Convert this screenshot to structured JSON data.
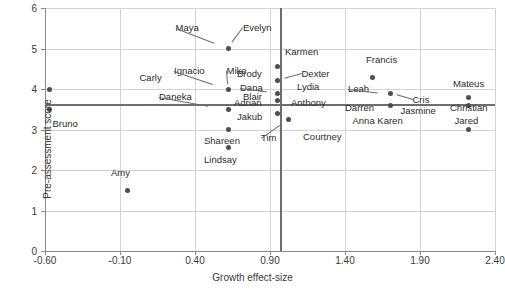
{
  "chart_data": {
    "type": "scatter",
    "title": "",
    "xlabel": "Growth effect-size",
    "ylabel": "Pre-assessment score",
    "xlim": [
      -0.6,
      2.4
    ],
    "ylim": [
      0,
      6
    ],
    "xticks": [
      "-0.60",
      "-0.10",
      "0.40",
      "0.90",
      "1.40",
      "1.90",
      "2.40"
    ],
    "xtick_values": [
      -0.6,
      -0.1,
      0.4,
      0.9,
      1.4,
      1.9,
      2.4
    ],
    "yticks": [
      "0",
      "1",
      "2",
      "3",
      "4",
      "5",
      "6"
    ],
    "ytick_values": [
      0,
      1,
      2,
      3,
      4,
      5,
      6
    ],
    "grid": true,
    "legend": "none",
    "reference_lines": [
      {
        "name": "mean-pre-assessment-line",
        "orientation": "horizontal",
        "value": 3.6
      },
      {
        "name": "mean-growth-line",
        "orientation": "vertical",
        "value": 0.97
      }
    ],
    "points": [
      {
        "label": "Carly",
        "x": -0.57,
        "y": 4.0,
        "lx": 0.03,
        "ly": 4.28,
        "anchor": "start",
        "leader": false
      },
      {
        "label": "Bruno",
        "x": -0.57,
        "y": 3.5,
        "lx": -0.55,
        "ly": 3.14,
        "anchor": "start",
        "leader": false
      },
      {
        "label": "Amy",
        "x": -0.05,
        "y": 1.5,
        "lx": -0.16,
        "ly": 1.92,
        "anchor": "start",
        "leader": false
      },
      {
        "label": "Evelyn",
        "x": 0.62,
        "y": 5.0,
        "lx": 0.72,
        "ly": 5.5,
        "anchor": "start",
        "leader": true
      },
      {
        "label": "Maya",
        "x": 0.62,
        "y": 5.0,
        "lx": 0.27,
        "ly": 5.5,
        "anchor": "start",
        "leader": true
      },
      {
        "label": "Mike",
        "x": 0.62,
        "y": 4.0,
        "lx": 0.61,
        "ly": 4.45,
        "anchor": "start",
        "leader": true
      },
      {
        "label": "Ignacio",
        "x": 0.62,
        "y": 4.0,
        "lx": 0.26,
        "ly": 4.45,
        "anchor": "start",
        "leader": true
      },
      {
        "label": "Blair",
        "x": 0.62,
        "y": 3.5,
        "lx": 0.72,
        "ly": 3.8,
        "anchor": "start",
        "leader": false
      },
      {
        "label": "Daneka",
        "x": 0.62,
        "y": 3.5,
        "lx": 0.16,
        "ly": 3.8,
        "anchor": "start",
        "leader": true
      },
      {
        "label": "Shareen",
        "x": 0.62,
        "y": 3.0,
        "lx": 0.46,
        "ly": 2.72,
        "anchor": "start",
        "leader": false
      },
      {
        "label": "Lindsay",
        "x": 0.62,
        "y": 2.55,
        "lx": 0.46,
        "ly": 2.25,
        "anchor": "start",
        "leader": false
      },
      {
        "label": "Karmen",
        "x": 0.95,
        "y": 4.55,
        "lx": 1.0,
        "ly": 4.92,
        "anchor": "start",
        "leader": false
      },
      {
        "label": "Brody",
        "x": 0.95,
        "y": 4.55,
        "lx": 0.68,
        "ly": 4.38,
        "anchor": "start",
        "leader": false
      },
      {
        "label": "Dexter",
        "x": 0.95,
        "y": 4.22,
        "lx": 1.11,
        "ly": 4.38,
        "anchor": "start",
        "leader": true
      },
      {
        "label": "Lydia",
        "x": 0.95,
        "y": 3.9,
        "lx": 1.08,
        "ly": 4.05,
        "anchor": "start",
        "leader": false
      },
      {
        "label": "Dana",
        "x": 0.95,
        "y": 3.9,
        "lx": 0.7,
        "ly": 4.02,
        "anchor": "start",
        "leader": true
      },
      {
        "label": "Adrian",
        "x": 0.95,
        "y": 3.72,
        "lx": 0.66,
        "ly": 3.66,
        "anchor": "start",
        "leader": false
      },
      {
        "label": "Anthony",
        "x": 0.95,
        "y": 3.72,
        "lx": 1.04,
        "ly": 3.66,
        "anchor": "start",
        "leader": false
      },
      {
        "label": "Jakub",
        "x": 0.95,
        "y": 3.4,
        "lx": 0.68,
        "ly": 3.3,
        "anchor": "start",
        "leader": false
      },
      {
        "label": "Tim",
        "x": 1.02,
        "y": 3.25,
        "lx": 0.84,
        "ly": 2.78,
        "anchor": "start",
        "leader": true
      },
      {
        "label": "Courtney",
        "x": 1.02,
        "y": 3.25,
        "lx": 1.12,
        "ly": 2.82,
        "anchor": "start",
        "leader": false
      },
      {
        "label": "Francis",
        "x": 1.58,
        "y": 4.28,
        "lx": 1.54,
        "ly": 4.72,
        "anchor": "start",
        "leader": false
      },
      {
        "label": "Leah",
        "x": 1.7,
        "y": 3.88,
        "lx": 1.42,
        "ly": 4.0,
        "anchor": "start",
        "leader": true
      },
      {
        "label": "Cris",
        "x": 1.7,
        "y": 3.88,
        "lx": 1.85,
        "ly": 3.72,
        "anchor": "start",
        "leader": true
      },
      {
        "label": "Darren",
        "x": 1.7,
        "y": 3.6,
        "lx": 1.4,
        "ly": 3.52,
        "anchor": "start",
        "leader": false
      },
      {
        "label": "Jasmine",
        "x": 1.7,
        "y": 3.6,
        "lx": 1.77,
        "ly": 3.46,
        "anchor": "start",
        "leader": false
      },
      {
        "label": "Anna Karen",
        "x": 1.7,
        "y": 3.6,
        "lx": 1.45,
        "ly": 3.2,
        "anchor": "start",
        "leader": false
      },
      {
        "label": "Mateus",
        "x": 2.22,
        "y": 3.78,
        "lx": 2.12,
        "ly": 4.12,
        "anchor": "start",
        "leader": false
      },
      {
        "label": "Christian",
        "x": 2.22,
        "y": 3.6,
        "lx": 2.1,
        "ly": 3.52,
        "anchor": "start",
        "leader": false
      },
      {
        "label": "Jared",
        "x": 2.22,
        "y": 3.0,
        "lx": 2.13,
        "ly": 3.22,
        "anchor": "start",
        "leader": false
      }
    ]
  },
  "colors": {
    "point": "#4d4d4d",
    "grid": "#d3d3d3",
    "axis": "#8a8a8a",
    "reference_line": "#6e6e6e",
    "text": "#2b2b2b",
    "background": "#ffffff"
  }
}
